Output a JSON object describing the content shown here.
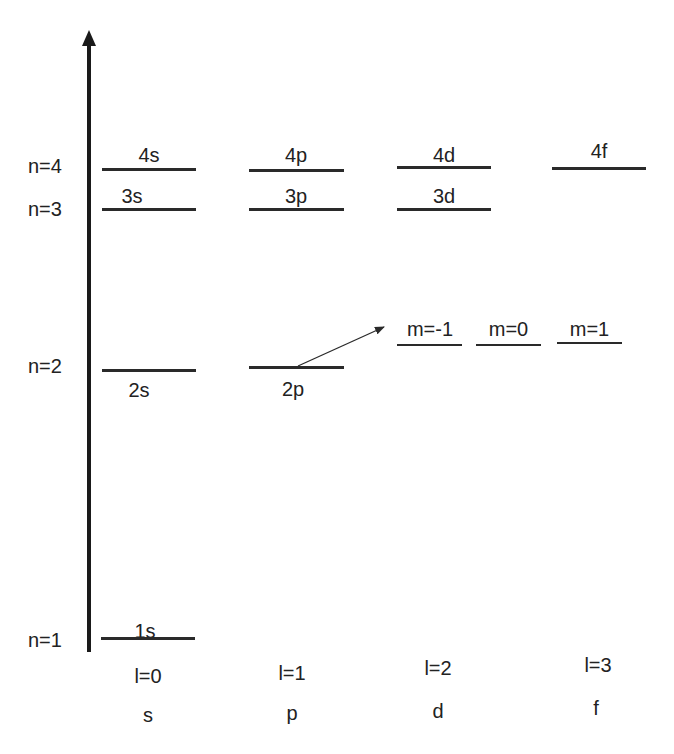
{
  "diagram": {
    "title": "",
    "axis": {
      "direction": "up",
      "meaning": "energy"
    },
    "n_levels": [
      {
        "label": "n=4"
      },
      {
        "label": "n=3"
      },
      {
        "label": "n=2"
      },
      {
        "label": "n=1"
      }
    ],
    "orbitals": {
      "s4": "4s",
      "s3": "3s",
      "s2": "2s",
      "s1": "1s",
      "p4": "4p",
      "p3": "3p",
      "p2": "2p",
      "d4": "4d",
      "d3": "3d",
      "f4": "4f"
    },
    "magnetic_sublevels": [
      {
        "label": "m=-1"
      },
      {
        "label": "m=0"
      },
      {
        "label": "m=1"
      }
    ],
    "columns": [
      {
        "l_label": "l=0",
        "letter": "s"
      },
      {
        "l_label": "l=1",
        "letter": "p"
      },
      {
        "l_label": "l=2",
        "letter": "d"
      },
      {
        "l_label": "l=3",
        "letter": "f"
      }
    ],
    "annotation": "arrow from 2p level to magnetic sublevels m=-1, m=0, m=1"
  }
}
